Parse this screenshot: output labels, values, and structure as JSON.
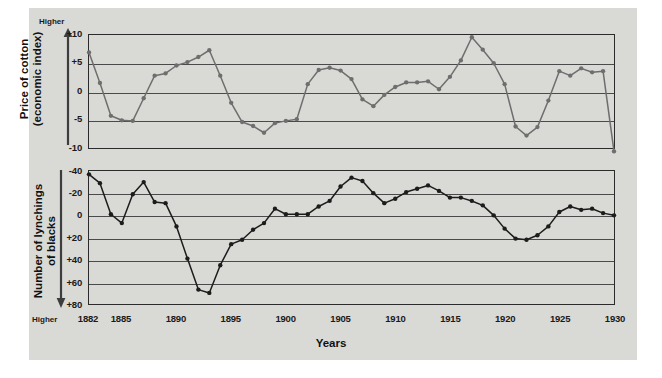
{
  "figure": {
    "background_color": "#d9d9d6",
    "x_axis_title": "Years",
    "top_panel": {
      "y_axis_title": "Price of cotton\n(economic index)",
      "y_axis_title_line1": "Price of cotton",
      "y_axis_title_line2": "(economic index)",
      "direction_label": "Higher",
      "direction": "up",
      "y_ticks": [
        "+10",
        "+5",
        "0",
        "-5",
        "-10"
      ]
    },
    "bottom_panel": {
      "y_axis_title_line1": "Number of lynchings",
      "y_axis_title_line2": "of blacks",
      "direction_label": "Higher",
      "direction": "down",
      "y_ticks": [
        "-40",
        "-20",
        "0",
        "+20",
        "+40",
        "+60",
        "+80"
      ]
    },
    "x_ticks": [
      "1882",
      "1885",
      "1890",
      "1895",
      "1900",
      "1905",
      "1910",
      "1915",
      "1920",
      "1925",
      "1930"
    ],
    "colors": {
      "panel": "#d9d9d6",
      "frame": "#2b2b2b",
      "grid": "#4a4a4a",
      "series_top": "#6e6e6e",
      "series_bottom": "#1c1c1c",
      "text": "#111111"
    }
  },
  "chart_data": [
    {
      "type": "line",
      "id": "price-of-cotton",
      "title": "Price of cotton (economic index)",
      "xlabel": "Years",
      "ylabel": "Price of cotton (economic index)",
      "ylim": [
        -10,
        10
      ],
      "xlim": [
        1882,
        1930
      ],
      "yticks": [
        10,
        5,
        0,
        -5,
        -10
      ],
      "ytick_labels": [
        "+10",
        "+5",
        "0",
        "-5",
        "-10"
      ],
      "xticks": [
        1882,
        1885,
        1890,
        1895,
        1900,
        1905,
        1910,
        1915,
        1920,
        1925,
        1930
      ],
      "grid": true,
      "legend": "none",
      "axis_direction_note": "Higher is up",
      "marker": "circle",
      "color": "#6e6e6e",
      "x": [
        1882,
        1883,
        1884,
        1885,
        1886,
        1887,
        1888,
        1889,
        1890,
        1891,
        1892,
        1893,
        1894,
        1895,
        1896,
        1897,
        1898,
        1899,
        1900,
        1901,
        1902,
        1903,
        1904,
        1905,
        1906,
        1907,
        1908,
        1909,
        1910,
        1911,
        1912,
        1913,
        1914,
        1915,
        1916,
        1917,
        1918,
        1919,
        1920,
        1921,
        1922,
        1923,
        1924,
        1925,
        1926,
        1927,
        1928,
        1929,
        1930
      ],
      "values": [
        6.9,
        1.5,
        -4.3,
        -5.1,
        -5.2,
        -1.2,
        2.8,
        3.2,
        4.6,
        5.2,
        6.1,
        7.3,
        2.8,
        -2.0,
        -5.4,
        -6.1,
        -7.3,
        -5.6,
        -5.2,
        -4.9,
        1.3,
        3.8,
        4.2,
        3.7,
        2.2,
        -1.4,
        -2.6,
        -0.6,
        0.8,
        1.6,
        1.6,
        1.8,
        0.4,
        2.6,
        5.5,
        9.6,
        7.4,
        5.0,
        1.3,
        -6.2,
        -7.8,
        -6.3,
        -1.6,
        3.6,
        2.8,
        4.1,
        3.4,
        3.6,
        -10.6
      ]
    },
    {
      "type": "line",
      "id": "lynchings-of-blacks",
      "title": "Number of lynchings of blacks",
      "xlabel": "Years",
      "ylabel": "Number of lynchings of blacks",
      "ylim": [
        -40,
        80
      ],
      "y_axis_inverted": true,
      "xlim": [
        1882,
        1930
      ],
      "yticks": [
        -40,
        -20,
        0,
        20,
        40,
        60,
        80
      ],
      "ytick_labels": [
        "-40",
        "-20",
        "0",
        "+20",
        "+40",
        "+60",
        "+80"
      ],
      "xticks": [
        1882,
        1885,
        1890,
        1895,
        1900,
        1905,
        1910,
        1915,
        1920,
        1925,
        1930
      ],
      "grid": true,
      "legend": "none",
      "axis_direction_note": "Higher is down (axis inverted)",
      "marker": "circle",
      "color": "#1c1c1c",
      "x": [
        1882,
        1883,
        1884,
        1885,
        1886,
        1887,
        1888,
        1889,
        1890,
        1891,
        1892,
        1893,
        1894,
        1895,
        1896,
        1897,
        1898,
        1899,
        1900,
        1901,
        1902,
        1903,
        1904,
        1905,
        1906,
        1907,
        1908,
        1909,
        1910,
        1911,
        1912,
        1913,
        1914,
        1915,
        1916,
        1917,
        1918,
        1919,
        1920,
        1921,
        1922,
        1923,
        1924,
        1925,
        1926,
        1927,
        1928,
        1929,
        1930
      ],
      "values": [
        -37,
        -29,
        -1,
        7,
        -19,
        -30,
        -12,
        -11,
        10,
        39,
        67,
        70,
        45,
        26,
        22,
        13,
        7,
        -6,
        -1,
        -1,
        -1,
        -8,
        -13,
        -26,
        -34,
        -31,
        -20,
        -11,
        -15,
        -21,
        -24,
        -27,
        -22,
        -16,
        -16,
        -13,
        -9,
        0,
        12,
        21,
        22,
        18,
        10,
        -3,
        -8,
        -5,
        -6,
        -2,
        0,
        3
      ]
    }
  ]
}
